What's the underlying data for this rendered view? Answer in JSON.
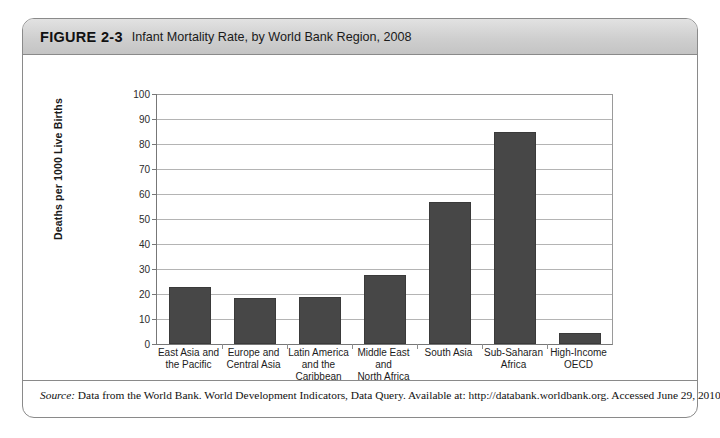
{
  "figure": {
    "number": "FIGURE 2-3",
    "caption": "Infant Mortality Rate, by World Bank Region, 2008",
    "source_label": "Source:",
    "source_text": " Data from the World Bank. World Development Indicators, Data Query. Available at: http://databank.worldbank.org. Accessed June 29, 2010."
  },
  "colors": {
    "bar_fill": "#474747",
    "bar_stroke": "#3a3a3a",
    "gridline": "#b4b4b4",
    "axis": "#777777",
    "header_band": "#cfcfcf",
    "frame_border": "#8a8a8a"
  },
  "chart_data": {
    "type": "bar",
    "title": "Infant Mortality Rate, by World Bank Region, 2008",
    "xlabel": "Region/Group",
    "ylabel": "Deaths per 1000 Live Births",
    "ylim": [
      0,
      100
    ],
    "yticks": [
      0,
      10,
      20,
      30,
      40,
      50,
      60,
      70,
      80,
      90,
      100
    ],
    "ytick_labels": [
      "0",
      "10",
      "20",
      "30",
      "40",
      "50",
      "60",
      "70",
      "80",
      "90",
      "100"
    ],
    "grid": true,
    "legend": false,
    "categories": [
      "East Asia and the Pacific",
      "Europe and Central Asia",
      "Latin America and the Caribbean",
      "Middle East and North Africa",
      "South Asia",
      "Sub-Saharan Africa",
      "High-Income OECD"
    ],
    "category_lines": [
      [
        "East Asia and",
        "the Pacific"
      ],
      [
        "Europe and",
        "Central Asia"
      ],
      [
        "Latin America",
        "and the",
        "Caribbean"
      ],
      [
        "Middle East",
        "and",
        "North Africa"
      ],
      [
        "South Asia"
      ],
      [
        "Sub-Saharan",
        "Africa"
      ],
      [
        "High-Income",
        "OECD"
      ]
    ],
    "values": [
      23,
      18.5,
      19,
      27.5,
      57,
      85,
      4.5
    ]
  }
}
